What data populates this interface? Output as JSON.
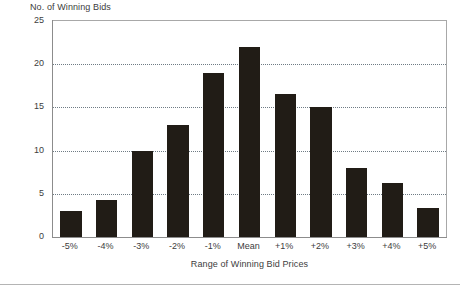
{
  "chart_data": {
    "type": "bar",
    "title": "",
    "ylabel": "No. of Winning Bids",
    "xlabel": "Range of Winning Bid Prices",
    "categories": [
      "-5%",
      "-4%",
      "-3%",
      "-2%",
      "-1%",
      "Mean",
      "+1%",
      "+2%",
      "+3%",
      "+4%",
      "+5%"
    ],
    "values": [
      3,
      4.3,
      10,
      13,
      19,
      22,
      16.5,
      15,
      8,
      6.3,
      3.4
    ],
    "ylim": [
      0,
      25
    ],
    "yticks": [
      0,
      5,
      10,
      15,
      20,
      25
    ],
    "ytick_labels": [
      "0",
      "5",
      "10",
      "15",
      "20",
      "25"
    ],
    "gridlines": [
      5,
      10,
      15,
      20
    ],
    "grid": true,
    "legend": "none",
    "bar_color": "#211c16",
    "grid_color": "#6f7b84",
    "axis_color": "#8c8c8c",
    "text_color": "#3d3d3d",
    "background": "#ffffff"
  }
}
